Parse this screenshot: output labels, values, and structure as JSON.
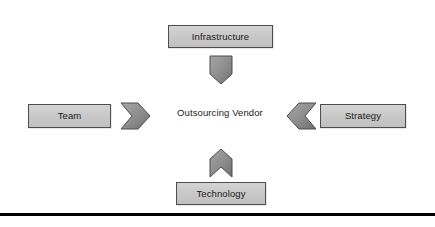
{
  "diagram": {
    "center": {
      "label": "Outsourcing Vendor"
    },
    "nodes": [
      {
        "id": "infrastructure",
        "label": "Infrastructure",
        "position": "top"
      },
      {
        "id": "team",
        "label": "Team",
        "position": "left"
      },
      {
        "id": "strategy",
        "label": "Strategy",
        "position": "right"
      },
      {
        "id": "technology",
        "label": "Technology",
        "position": "bottom"
      }
    ],
    "arrows": [
      {
        "id": "arrow-down",
        "from": "infrastructure",
        "to": "center",
        "direction": "down"
      },
      {
        "id": "arrow-right",
        "from": "team",
        "to": "center",
        "direction": "right"
      },
      {
        "id": "arrow-left",
        "from": "strategy",
        "to": "center",
        "direction": "left"
      },
      {
        "id": "arrow-up",
        "from": "technology",
        "to": "center",
        "direction": "up"
      }
    ],
    "colors": {
      "box_fill": "#c9c9c9",
      "box_border": "#4d4d4d",
      "arrow_fill": "#8c8c8c",
      "arrow_border": "#4d4d4d",
      "text": "#1a1a1a",
      "rule": "#000000",
      "background": "#ffffff"
    }
  }
}
